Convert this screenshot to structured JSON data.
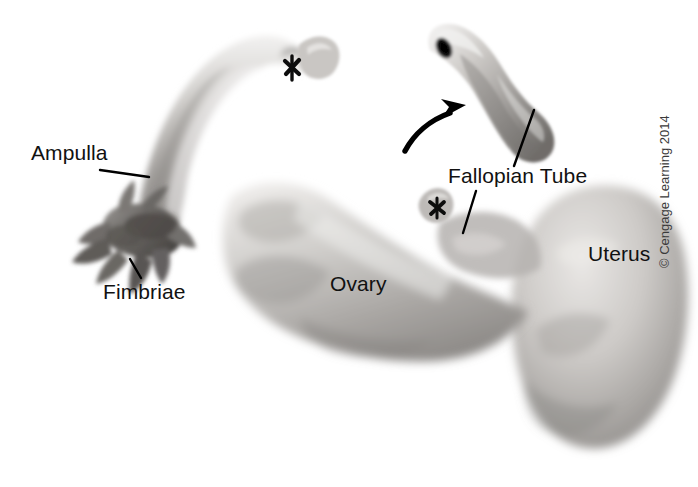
{
  "figure": {
    "background_color": "#ffffff",
    "width": 698,
    "height": 487
  },
  "labels": [
    {
      "id": "ampulla",
      "text": "Ampulla",
      "has_leader_line": true
    },
    {
      "id": "fimbriae",
      "text": "Fimbriae",
      "has_leader_line": true
    },
    {
      "id": "ovary",
      "text": "Ovary",
      "has_leader_line": false
    },
    {
      "id": "fallopian",
      "text": "Fallopian Tube",
      "has_leader_line": true
    },
    {
      "id": "uterus",
      "text": "Uterus",
      "has_leader_line": false
    }
  ],
  "annotations": {
    "arrow": "curved-arrow-pointing-to-inset",
    "cross_marks": [
      "x-mark-upper-tube",
      "x-mark-lower-tube"
    ]
  },
  "colors": {
    "text": "#111111",
    "leader_line": "#000000",
    "tissue_light": "#e6e4e2",
    "tissue_mid": "#b9b6b3",
    "tissue_dark": "#7e7b78",
    "copyright_text": "#3a3a3a"
  },
  "copyright": {
    "text": "© Cengage Learning 2014"
  }
}
